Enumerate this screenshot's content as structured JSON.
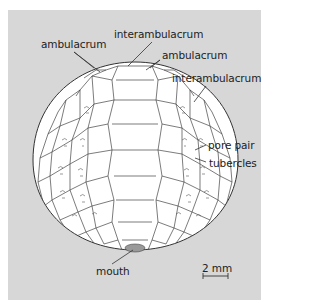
{
  "figure": {
    "background_color": "#d7d7d7",
    "labels": {
      "ambulacrum_left": "ambulacrum",
      "interambulacrum_top": "interambulacrum",
      "ambulacrum_right": "ambulacrum",
      "interambulacrum_right": "interambulacrum",
      "pore_pair": "pore pair",
      "tubercles": "tubercles",
      "mouth": "mouth"
    },
    "scale_bar": {
      "label": "2 mm"
    }
  }
}
